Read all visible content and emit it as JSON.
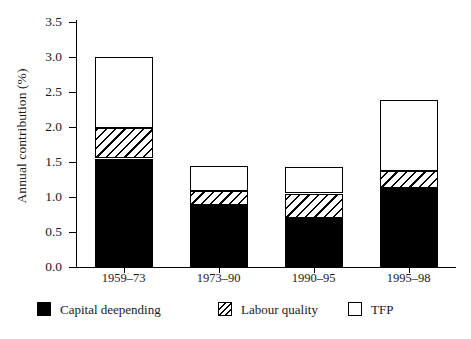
{
  "chart_data": {
    "type": "bar",
    "subtype": "stacked-vertical",
    "title": "",
    "xlabel": "",
    "ylabel": "Annual contribution (%)",
    "ylim": [
      0.0,
      3.5
    ],
    "yticks": [
      "0.0",
      "0.5",
      "1.0",
      "1.5",
      "2.0",
      "2.5",
      "3.0",
      "3.5"
    ],
    "ytick_values": [
      0.0,
      0.5,
      1.0,
      1.5,
      2.0,
      2.5,
      3.0,
      3.5
    ],
    "grid": false,
    "legend_position": "bottom",
    "categories": [
      "1959–73",
      "1973–90",
      "1990–95",
      "1995–98"
    ],
    "series": [
      {
        "name": "Capital deepending",
        "fill": "solid-black",
        "color": "#000000",
        "values": [
          1.55,
          0.89,
          0.7,
          1.13
        ]
      },
      {
        "name": "Labour quality",
        "fill": "diagonal-hatch",
        "color": "#ffffff",
        "values": [
          0.43,
          0.19,
          0.35,
          0.24
        ]
      },
      {
        "name": "TFP",
        "fill": "white",
        "color": "#ffffff",
        "values": [
          1.02,
          0.37,
          0.38,
          1.01
        ]
      }
    ],
    "totals": [
      3.0,
      1.45,
      1.43,
      2.38
    ],
    "cumulative": [
      [
        1.55,
        1.98,
        3.0
      ],
      [
        0.89,
        1.08,
        1.45
      ],
      [
        0.7,
        1.05,
        1.43
      ],
      [
        1.13,
        1.37,
        2.38
      ]
    ]
  },
  "legend": {
    "items": [
      {
        "label": "Capital deepending",
        "swatch": "solid-black-swatch"
      },
      {
        "label": "Labour quality",
        "swatch": "diagonal-hatch-swatch"
      },
      {
        "label": "TFP",
        "swatch": "white-swatch"
      }
    ]
  },
  "axes": {
    "y_title": "Annual contribution (%)"
  }
}
